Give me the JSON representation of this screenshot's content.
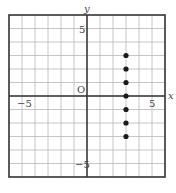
{
  "chart_data": {
    "type": "scatter",
    "title": "",
    "xlabel": "x",
    "ylabel": "y",
    "origin_label": "O",
    "xlim": [
      -6,
      6
    ],
    "ylim": [
      -6,
      6
    ],
    "grid": true,
    "grid_step": 1,
    "x_tick_labels": [
      {
        "value": -5,
        "label": "−5"
      },
      {
        "value": 5,
        "label": "5"
      }
    ],
    "y_tick_labels": [
      {
        "value": 5,
        "label": "5"
      },
      {
        "value": -5,
        "label": "−5"
      }
    ],
    "points": [
      {
        "x": 3,
        "y": 3
      },
      {
        "x": 3,
        "y": 2
      },
      {
        "x": 3,
        "y": 1
      },
      {
        "x": 3,
        "y": 0
      },
      {
        "x": 3,
        "y": -1
      },
      {
        "x": 3,
        "y": -2
      },
      {
        "x": 3,
        "y": -3
      }
    ]
  }
}
